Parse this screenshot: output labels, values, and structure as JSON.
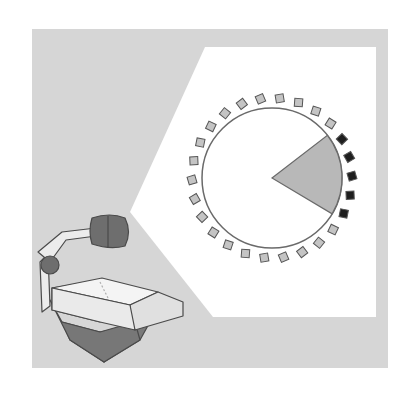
{
  "illustration": {
    "subject": "overhead projector projecting a circular seating diagram",
    "colors": {
      "background_panel": "#d6d6d6",
      "projection": "#ffffff",
      "outline": "#5a5a5a",
      "seat_light": "#c4c4c4",
      "seat_dark": "#1e1e1e",
      "wedge": "#b8b8b8",
      "projector_dark": "#6e6e6e",
      "projector_body": "#eeeeee"
    },
    "diagram": {
      "seat_count": 26,
      "highlighted_seats": 5,
      "wedge_fraction": 0.19
    }
  }
}
